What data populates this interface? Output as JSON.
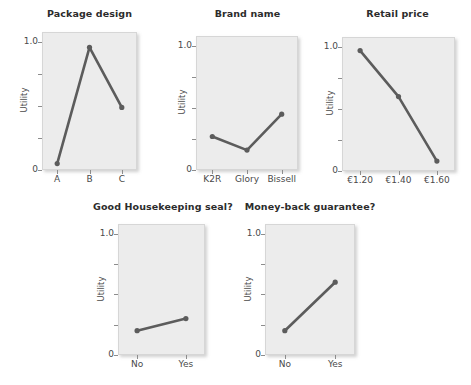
{
  "figure": {
    "ylabel": "Utility",
    "ytick_labels": [
      "1.0",
      "0"
    ],
    "ylim": [
      0,
      1.08
    ],
    "yticks": [
      0,
      0.25,
      0.5,
      0.75,
      1.0
    ]
  },
  "chart_data": [
    {
      "type": "line",
      "title": "Package design",
      "xlabel": "",
      "ylabel": "Utility",
      "categories": [
        "A",
        "B",
        "C"
      ],
      "values": [
        0.05,
        0.96,
        0.49
      ],
      "ylim": [
        0,
        1.08
      ],
      "yticks": [
        0,
        0.25,
        0.5,
        0.75,
        1.0
      ],
      "ytick_labels": [
        "0",
        "",
        "",
        "",
        "1.0"
      ],
      "grid": false,
      "legend": "none"
    },
    {
      "type": "line",
      "title": "Brand name",
      "xlabel": "",
      "ylabel": "Utility",
      "categories": [
        "K2R",
        "Glory",
        "Bissell"
      ],
      "values": [
        0.27,
        0.16,
        0.45
      ],
      "ylim": [
        0,
        1.08
      ],
      "yticks": [
        0,
        0.25,
        0.5,
        0.75,
        1.0
      ],
      "ytick_labels": [
        "0",
        "",
        "",
        "",
        "1.0"
      ],
      "grid": false,
      "legend": "none"
    },
    {
      "type": "line",
      "title": "Retail price",
      "xlabel": "",
      "ylabel": "Utility",
      "categories": [
        "€1.20",
        "€1.40",
        "€1.60"
      ],
      "values": [
        0.97,
        0.6,
        0.08
      ],
      "ylim": [
        0,
        1.08
      ],
      "yticks": [
        0,
        0.25,
        0.5,
        0.75,
        1.0
      ],
      "ytick_labels": [
        "0",
        "",
        "",
        "",
        "1.0"
      ],
      "grid": false,
      "legend": "none"
    },
    {
      "type": "line",
      "title": "Good Housekeeping seal?",
      "xlabel": "",
      "ylabel": "Utility",
      "categories": [
        "No",
        "Yes"
      ],
      "values": [
        0.2,
        0.3
      ],
      "ylim": [
        0,
        1.08
      ],
      "yticks": [
        0,
        0.25,
        0.5,
        0.75,
        1.0
      ],
      "ytick_labels": [
        "0",
        "",
        "",
        "",
        "1.0"
      ],
      "grid": false,
      "legend": "none"
    },
    {
      "type": "line",
      "title": "Money-back guarantee?",
      "xlabel": "",
      "ylabel": "Utility",
      "categories": [
        "No",
        "Yes"
      ],
      "values": [
        0.2,
        0.6
      ],
      "ylim": [
        0,
        1.08
      ],
      "yticks": [
        0,
        0.25,
        0.5,
        0.75,
        1.0
      ],
      "ytick_labels": [
        "0",
        "",
        "",
        "",
        "1.0"
      ],
      "grid": false,
      "legend": "none"
    }
  ],
  "colors": {
    "line": "#5c5c5c",
    "panel_background": "#ececec",
    "panel_border": "#d6d6d6",
    "text": "#3a3a3a"
  }
}
